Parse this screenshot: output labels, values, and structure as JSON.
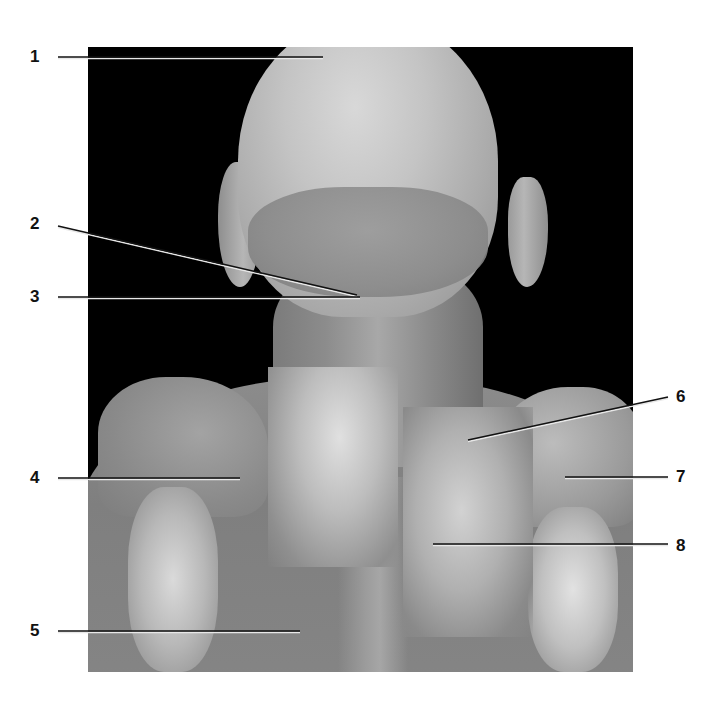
{
  "figure": {
    "type": "anatomical dissection photograph",
    "view": "posterior head, neck and upper back",
    "background_color": "#000000",
    "line_color_dark": "#111111",
    "line_color_light": "#e8e8e8"
  },
  "labels": [
    {
      "id": "1",
      "text": "1",
      "side": "left",
      "x": 37,
      "y": 57,
      "line": [
        58,
        57,
        323,
        57
      ]
    },
    {
      "id": "2",
      "text": "2",
      "side": "left",
      "x": 37,
      "y": 224,
      "line": [
        58,
        226,
        357,
        295
      ]
    },
    {
      "id": "3",
      "text": "3",
      "side": "left",
      "x": 37,
      "y": 297,
      "line": [
        58,
        297,
        360,
        297
      ]
    },
    {
      "id": "4",
      "text": "4",
      "side": "left",
      "x": 37,
      "y": 478,
      "line": [
        58,
        478,
        240,
        478
      ]
    },
    {
      "id": "5",
      "text": "5",
      "side": "left",
      "x": 37,
      "y": 631,
      "line": [
        58,
        631,
        300,
        631
      ]
    },
    {
      "id": "6",
      "text": "6",
      "side": "right",
      "x": 683,
      "y": 397,
      "line": [
        668,
        397,
        468,
        440
      ]
    },
    {
      "id": "7",
      "text": "7",
      "side": "right",
      "x": 683,
      "y": 477,
      "line": [
        668,
        477,
        565,
        477
      ]
    },
    {
      "id": "8",
      "text": "8",
      "side": "right",
      "x": 683,
      "y": 547,
      "line": [
        668,
        544,
        433,
        544
      ]
    }
  ]
}
